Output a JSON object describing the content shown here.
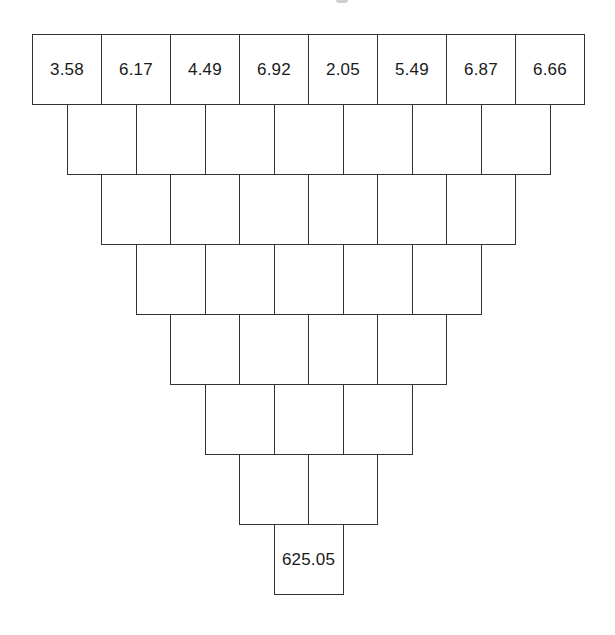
{
  "diagram": {
    "type": "number-pyramid (inverted)",
    "rows": [
      [
        "3.58",
        "6.17",
        "4.49",
        "6.92",
        "2.05",
        "5.49",
        "6.87",
        "6.66"
      ],
      [
        "",
        "",
        "",
        "",
        "",
        "",
        ""
      ],
      [
        "",
        "",
        "",
        "",
        "",
        ""
      ],
      [
        "",
        "",
        "",
        "",
        ""
      ],
      [
        "",
        "",
        "",
        ""
      ],
      [
        "",
        "",
        ""
      ],
      [
        "",
        ""
      ],
      [
        "625.05"
      ]
    ],
    "layout": {
      "origin_x": 32,
      "origin_y": 34,
      "cell_width": 69,
      "cell_height": 70,
      "row_shift": 34.5
    },
    "colors": {
      "border": "#333333",
      "text": "#1a1a1a",
      "background": "#ffffff"
    }
  }
}
